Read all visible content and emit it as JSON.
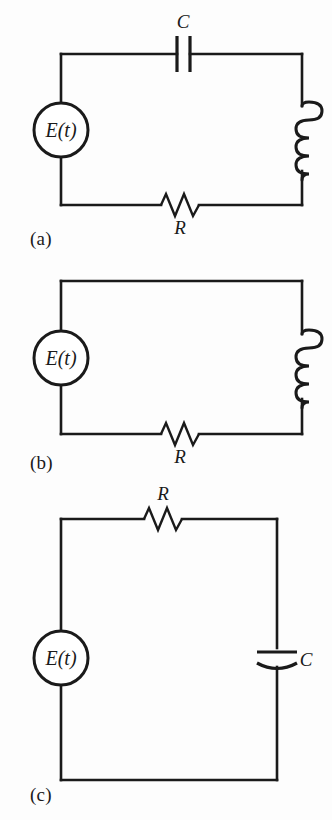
{
  "figure": {
    "background_color": "#fdfdfd",
    "ink_color": "#1a1a1a",
    "panel_count": 3
  },
  "panels": [
    {
      "id": "a",
      "label": "(a)",
      "description": "Series circuit with voltage source, capacitor, inductor and resistor",
      "source_label": "E(t)",
      "components": [
        {
          "name": "capacitor",
          "label": "C",
          "symbol": "parallel-plate",
          "position": "top"
        },
        {
          "name": "inductor",
          "label": "",
          "symbol": "coil",
          "position": "right"
        },
        {
          "name": "resistor",
          "label": "R",
          "symbol": "zigzag",
          "position": "bottom"
        },
        {
          "name": "source",
          "label": "E(t)",
          "symbol": "circle",
          "position": "left"
        }
      ]
    },
    {
      "id": "b",
      "label": "(b)",
      "description": "Series circuit with voltage source, inductor and resistor",
      "source_label": "E(t)",
      "components": [
        {
          "name": "inductor",
          "label": "",
          "symbol": "coil",
          "position": "right"
        },
        {
          "name": "resistor",
          "label": "R",
          "symbol": "zigzag",
          "position": "bottom"
        },
        {
          "name": "source",
          "label": "E(t)",
          "symbol": "circle",
          "position": "left"
        }
      ]
    },
    {
      "id": "c",
      "label": "(c)",
      "description": "Series circuit with voltage source, resistor and capacitor",
      "source_label": "E(t)",
      "components": [
        {
          "name": "resistor",
          "label": "R",
          "symbol": "zigzag",
          "position": "top"
        },
        {
          "name": "capacitor",
          "label": "C",
          "symbol": "curved-plate",
          "position": "right"
        },
        {
          "name": "source",
          "label": "E(t)",
          "symbol": "circle",
          "position": "left"
        }
      ]
    }
  ],
  "labels": {
    "source": "E(t)",
    "resistor": "R",
    "capacitor": "C",
    "panel_a": "(a)",
    "panel_b": "(b)",
    "panel_c": "(c)"
  }
}
